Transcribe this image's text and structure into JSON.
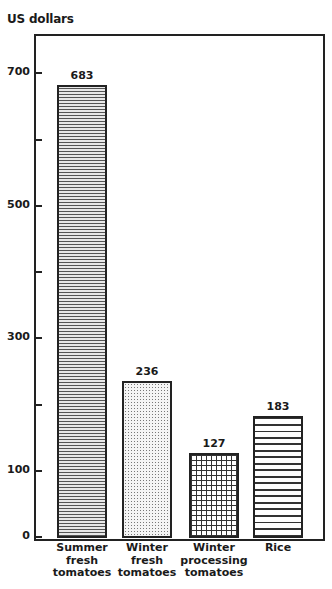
{
  "chart_data": {
    "type": "bar",
    "title": "",
    "ylabel": "US dollars",
    "xlabel": "",
    "categories": [
      "Summer fresh tomatoes",
      "Winter fresh tomatoes",
      "Winter processing tomatoes",
      "Rice"
    ],
    "category_lines": [
      [
        "Summer",
        "fresh",
        "tomatoes"
      ],
      [
        "Winter",
        "fresh",
        "tomatoes"
      ],
      [
        "Winter",
        "processing",
        "tomatoes"
      ],
      [
        "Rice"
      ]
    ],
    "values": [
      683,
      236,
      127,
      183
    ],
    "value_labels": [
      "683",
      "236",
      "127",
      "183"
    ],
    "patterns": [
      "fine horizontal stripes",
      "stipple dots",
      "grid",
      "wide horizontal stripes"
    ],
    "ylim": [
      0,
      760
    ],
    "yticks": [
      0,
      100,
      200,
      300,
      400,
      500,
      600,
      700
    ],
    "ytick_labels": [
      "0",
      "100",
      "",
      "300",
      "",
      "500",
      "",
      "700"
    ],
    "grid": false,
    "legend": null
  }
}
